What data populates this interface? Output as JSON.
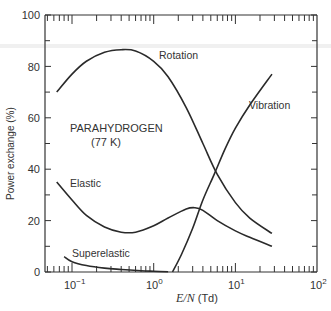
{
  "chart_data": {
    "type": "line",
    "title": "",
    "xlabel": "E/N (Td)",
    "xlabel_italic": "E/N",
    "xlabel_unit": "(Td)",
    "ylabel": "Power exchange (%)",
    "xscale": "log",
    "xlim": [
      0.05,
      100
    ],
    "ylim": [
      0,
      100
    ],
    "grid": false,
    "x_tick_labels": [
      "10⁻¹",
      "10⁰",
      "10¹",
      "10²"
    ],
    "x_tick_values": [
      0.1,
      1,
      10,
      100
    ],
    "y_tick_labels": [
      "0",
      "20",
      "40",
      "60",
      "80",
      "100"
    ],
    "y_tick_values": [
      0,
      20,
      40,
      60,
      80,
      100
    ],
    "annotations": [
      {
        "text": "PARAHYDROGEN",
        "x": 0.11,
        "y": 55
      },
      {
        "text": "(77 K)",
        "x": 0.16,
        "y": 50
      }
    ],
    "series": [
      {
        "name": "Rotation",
        "x": [
          0.065,
          0.1,
          0.15,
          0.25,
          0.4,
          0.6,
          1.0,
          1.5,
          2.5,
          4,
          6,
          10,
          15,
          28
        ],
        "y": [
          70,
          77,
          82,
          85.5,
          86.5,
          86,
          82,
          76,
          64,
          50,
          38,
          27,
          21,
          15
        ]
      },
      {
        "name": "Vibration",
        "x": [
          1.7,
          2.2,
          3,
          4,
          5.5,
          7.5,
          10,
          15,
          28
        ],
        "y": [
          0,
          7,
          17,
          28,
          38,
          48,
          56,
          65,
          77
        ]
      },
      {
        "name": "Elastic",
        "x": [
          0.065,
          0.1,
          0.15,
          0.25,
          0.4,
          0.6,
          1.0,
          1.5,
          2.5,
          3.2,
          4,
          6,
          10,
          15,
          28
        ],
        "y": [
          35,
          28,
          22,
          17.5,
          15.5,
          15.5,
          18,
          21,
          24.5,
          25,
          24,
          20,
          16,
          13.5,
          10
        ]
      },
      {
        "name": "Superelastic",
        "x": [
          0.08,
          0.1,
          0.15,
          0.25,
          0.4,
          0.7,
          1.0,
          1.5
        ],
        "y": [
          6,
          4,
          2.5,
          1.5,
          1,
          0.5,
          0.3,
          0.1
        ]
      }
    ],
    "legend": "inline labels next to curves"
  },
  "labels": {
    "rotation": "Rotation",
    "vibration": "Vibration",
    "elastic": "Elastic",
    "superelastic": "Superelastic",
    "gas": "PARAHYDROGEN",
    "temperature": "(77 K)"
  },
  "axes": {
    "ylabel": "Power exchange (%)",
    "xlabel_italic": "E/N",
    "xlabel_unit": " (Td)",
    "y_ticks": [
      "0",
      "20",
      "40",
      "60",
      "80",
      "100"
    ],
    "x_ticks": {
      "base": [
        "10",
        "10",
        "10",
        "10"
      ],
      "exp": [
        "−1",
        "0",
        "1",
        "2"
      ]
    }
  }
}
